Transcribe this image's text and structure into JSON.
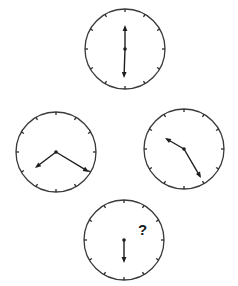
{
  "puzzle": {
    "description": "Clock sequence puzzle",
    "colors": {
      "stroke": "#3a3a3a",
      "hand": "#1e1e1e",
      "background": "#ffffff"
    },
    "clocks": [
      {
        "id": "top",
        "cx": 125,
        "cy": 49,
        "r": 40,
        "hands": [
          {
            "x": 125,
            "y": 25
          },
          {
            "x": 124,
            "y": 78
          }
        ]
      },
      {
        "id": "left",
        "cx": 56,
        "cy": 152,
        "r": 40,
        "hands": [
          {
            "x": 35,
            "y": 168
          },
          {
            "x": 89,
            "y": 172
          }
        ]
      },
      {
        "id": "right",
        "cx": 184,
        "cy": 149,
        "r": 40,
        "hands": [
          {
            "x": 165,
            "y": 138
          },
          {
            "x": 201,
            "y": 178
          }
        ]
      },
      {
        "id": "bottom",
        "cx": 124,
        "cy": 240,
        "r": 40,
        "hands": [
          {
            "x": 124,
            "y": 263
          }
        ]
      }
    ],
    "question_mark": {
      "text": "?",
      "x": 138,
      "y": 235
    }
  }
}
